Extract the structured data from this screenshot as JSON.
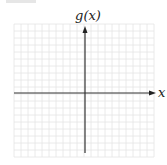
{
  "figure": {
    "y_axis_label": "g(x)",
    "x_axis_label": "x",
    "grid": {
      "left": 14,
      "top": 24,
      "cols": 20,
      "rows": 19,
      "cell": 7,
      "color": "#e4e4e4"
    },
    "origin": {
      "x": 85,
      "y": 93
    },
    "axis_color": "#333333"
  },
  "chart_data": {
    "type": "coordinate-plane",
    "title": "",
    "xlabel": "x",
    "ylabel": "g(x)",
    "grid": true,
    "series": []
  }
}
